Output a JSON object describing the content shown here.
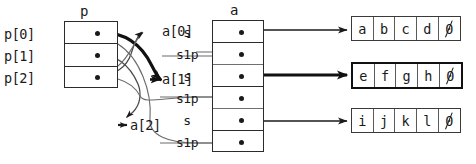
{
  "diagram": {
    "pointer_table": {
      "name": "p",
      "rows": [
        {
          "label": "p[0]",
          "value": "pointer"
        },
        {
          "label": "p[1]",
          "value": "pointer"
        },
        {
          "label": "p[2]",
          "value": "pointer"
        }
      ]
    },
    "struct_table": {
      "name": "a",
      "index_labels": [
        "a[0]",
        "a[1]",
        "a[2]"
      ],
      "rows": [
        {
          "field": "s",
          "value": "pointer"
        },
        {
          "field": "s1p",
          "value": "pointer"
        },
        {
          "field": "s",
          "value": "pointer"
        },
        {
          "field": "s1p",
          "value": "pointer"
        },
        {
          "field": "s",
          "value": "pointer"
        },
        {
          "field": "s1p",
          "value": "pointer"
        }
      ]
    },
    "strings": [
      {
        "id": "str0",
        "cells": [
          "a",
          "b",
          "c",
          "d"
        ],
        "terminator": "0",
        "emphasis": "normal"
      },
      {
        "id": "str1",
        "cells": [
          "e",
          "f",
          "g",
          "h"
        ],
        "terminator": "0",
        "emphasis": "bold"
      },
      {
        "id": "str2",
        "cells": [
          "i",
          "j",
          "k",
          "l"
        ],
        "terminator": "0",
        "emphasis": "normal"
      }
    ],
    "colors": {
      "ink": "#1a1a1a",
      "border": "#2b2b2b",
      "light_rule": "#707070",
      "background": "#ffffff",
      "emphasis": "#111111"
    }
  }
}
